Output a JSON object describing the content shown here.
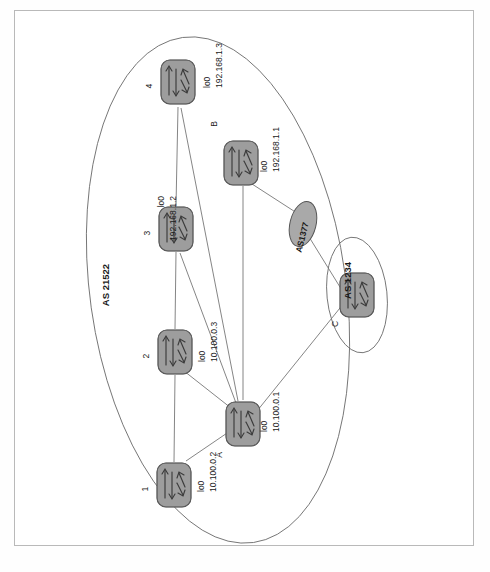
{
  "figure": {
    "type": "network-topology-diagram",
    "orientation": "rotated-90-ccw",
    "caption": ""
  },
  "domains": [
    {
      "id": "as21522",
      "label": "AS 21522",
      "shape": "ellipse",
      "members": [
        "1",
        "2",
        "3",
        "4",
        "A",
        "B"
      ]
    },
    {
      "id": "as1234",
      "label": "AS 1234",
      "shape": "ellipse",
      "members": [
        "C"
      ]
    }
  ],
  "clouds": [
    {
      "id": "as1377",
      "label": "AS1377",
      "shape": "oval"
    }
  ],
  "routers": [
    {
      "id": "r4",
      "name": "4",
      "iface": "lo0",
      "ip": "192.168.1.3"
    },
    {
      "id": "r3",
      "name": "3",
      "iface": "lo0",
      "ip": "192.168.1.2"
    },
    {
      "id": "r2",
      "name": "2",
      "iface": "lo0",
      "ip": "10.100.0.3"
    },
    {
      "id": "r1",
      "name": "1",
      "iface": "lo0",
      "ip": "10.100.0.2"
    },
    {
      "id": "rA",
      "name": "A",
      "iface": "lo0",
      "ip": "10.100.0.1"
    },
    {
      "id": "rB",
      "name": "B",
      "iface": "lo0",
      "ip": "192.168.1.1"
    },
    {
      "id": "rC",
      "name": "C",
      "iface": "",
      "ip": ""
    }
  ],
  "links": [
    {
      "from": "r4",
      "to": "r3"
    },
    {
      "from": "r3",
      "to": "r2"
    },
    {
      "from": "r2",
      "to": "r1"
    },
    {
      "from": "r4",
      "to": "rA"
    },
    {
      "from": "r3",
      "to": "rA"
    },
    {
      "from": "r2",
      "to": "rA"
    },
    {
      "from": "r1",
      "to": "rA"
    },
    {
      "from": "rB",
      "to": "rA"
    },
    {
      "from": "rB",
      "to": "as1377"
    },
    {
      "from": "as1377",
      "to": "rC"
    },
    {
      "from": "rA",
      "to": "rC"
    }
  ],
  "colors": {
    "router_fill": "#9a9a9a",
    "router_stroke": "#4a4a4a",
    "cloud_fill": "#a8a8a8",
    "line": "#777777",
    "ellipse_stroke": "#6f6f6f",
    "frame": "#b9b9b9",
    "text": "#1a1a1a"
  }
}
